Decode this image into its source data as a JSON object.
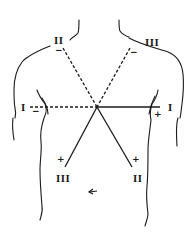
{
  "diagram": {
    "type": "ecg-limb-lead-axes",
    "colors": {
      "ink": "#1a1a1a",
      "background": "#ffffff"
    },
    "leads": [
      {
        "name": "I",
        "label_negative": "I",
        "label_positive": "I",
        "negative_sign": "−",
        "positive_sign": "+"
      },
      {
        "name": "II",
        "label_negative": "II",
        "label_positive": "II",
        "negative_sign": "−",
        "positive_sign": "+"
      },
      {
        "name": "III",
        "label_negative": "III",
        "label_positive": "III",
        "negative_sign": "−",
        "positive_sign": "+"
      }
    ],
    "annotation": {
      "arrow_symbol": "arrow"
    }
  }
}
